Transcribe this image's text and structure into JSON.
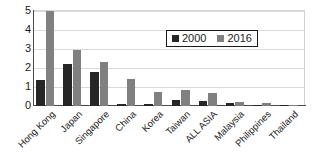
{
  "chart_data": {
    "type": "bar",
    "title": "",
    "xlabel": "",
    "ylabel": "",
    "ylim": [
      0,
      5
    ],
    "yticks": [
      0,
      1,
      2,
      3,
      4,
      5
    ],
    "grid": true,
    "legend_position": "upper-right-inside",
    "categories": [
      "Hong Kong",
      "Japan",
      "Singapore",
      "China",
      "Korea",
      "Taiwan",
      "ALL ASIA",
      "Malaysia",
      "Philippines",
      "Thailand"
    ],
    "series": [
      {
        "name": "2000",
        "color": "#262626",
        "values": [
          1.35,
          2.2,
          1.75,
          0.1,
          0.1,
          0.3,
          0.25,
          0.15,
          0.05,
          0.05
        ]
      },
      {
        "name": "2016",
        "color": "#808080",
        "values": [
          4.95,
          2.9,
          2.3,
          1.4,
          0.75,
          0.85,
          0.7,
          0.2,
          0.15,
          0.07
        ]
      }
    ]
  },
  "legend": {
    "entries": [
      {
        "label": "2000",
        "color": "#262626"
      },
      {
        "label": "2016",
        "color": "#808080"
      }
    ]
  },
  "axis": {
    "y_tick_labels": [
      "5",
      "4",
      "3",
      "2",
      "1",
      "0"
    ]
  }
}
